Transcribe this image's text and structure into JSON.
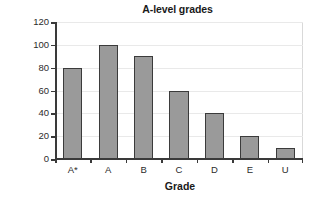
{
  "chart_data": {
    "type": "bar",
    "title": "A-level grades",
    "xlabel": "Grade",
    "ylabel": "Frequency",
    "categories": [
      "A*",
      "A",
      "B",
      "C",
      "D",
      "E",
      "U"
    ],
    "values": [
      80,
      100,
      90,
      60,
      40,
      20,
      10
    ],
    "ylim": [
      0,
      120
    ],
    "ytick_step": 20,
    "yticks": [
      0,
      20,
      40,
      60,
      80,
      100,
      120
    ],
    "ytick_labels": [
      "0",
      "20",
      "40",
      "60",
      "80",
      "100",
      "120"
    ],
    "grid": true,
    "grid_axis": "y",
    "legend": false,
    "bar_color": "#9a9a9a",
    "bar_edge_color": "#3b3b3b",
    "grid_color": "#e9e9e9",
    "axis_color": "#3a3a3a",
    "background_color": "#ffffff"
  }
}
